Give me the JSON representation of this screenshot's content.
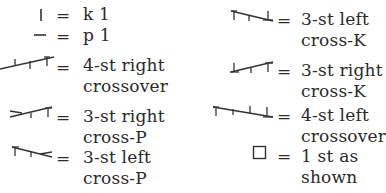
{
  "legend": {
    "equals": "=",
    "left_column": [
      {
        "symbol": "knit-symbol",
        "line1": "k 1",
        "line2": ""
      },
      {
        "symbol": "purl-symbol",
        "line1": "p 1",
        "line2": ""
      },
      {
        "symbol": "4-st-right-crossover-symbol",
        "line1": "4-st right",
        "line2": "crossover"
      },
      {
        "symbol": "3-st-right-cross-p-symbol",
        "line1": "3-st right",
        "line2": "cross-P"
      },
      {
        "symbol": "3-st-left-cross-p-symbol",
        "line1": "3-st left",
        "line2": "cross-P"
      }
    ],
    "right_column": [
      {
        "symbol": "3-st-left-cross-k-symbol",
        "line1": "3-st left",
        "line2": "cross-K"
      },
      {
        "symbol": "3-st-right-cross-k-symbol",
        "line1": "3-st right",
        "line2": "cross-K"
      },
      {
        "symbol": "4-st-left-crossover-symbol",
        "line1": "4-st left",
        "line2": "crossover"
      },
      {
        "symbol": "empty-square-symbol",
        "line1": "1 st as",
        "line2": "shown"
      }
    ]
  }
}
